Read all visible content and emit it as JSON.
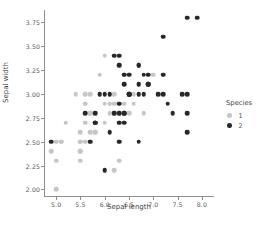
{
  "chart_data": {
    "type": "scatter",
    "title": "",
    "xlabel": "Sepal length",
    "ylabel": "Sepal width",
    "xlim": [
      4.75,
      8.25
    ],
    "ylim": [
      1.92,
      3.88
    ],
    "xticks": [
      "5.0",
      "5.5",
      "6.0",
      "6.5",
      "7.0",
      "7.5",
      "8.0"
    ],
    "xtick_values": [
      5.0,
      5.5,
      6.0,
      6.5,
      7.0,
      7.5,
      8.0
    ],
    "yticks": [
      "2.00",
      "2.25",
      "2.50",
      "2.75",
      "3.00",
      "3.25",
      "3.50",
      "3.75"
    ],
    "ytick_values": [
      2.0,
      2.25,
      2.5,
      2.75,
      3.0,
      3.25,
      3.5,
      3.75
    ],
    "grid": false,
    "legend": {
      "title": "Species",
      "position": "right",
      "entries": [
        {
          "label": "1",
          "color": "#c6c6c6"
        },
        {
          "label": "2",
          "color": "#272727"
        }
      ]
    },
    "series": [
      {
        "name": "1",
        "color": "#c6c6c6",
        "points": [
          [
            5.0,
            2.0
          ],
          [
            5.0,
            2.3
          ],
          [
            5.5,
            2.3
          ],
          [
            5.5,
            2.4
          ],
          [
            4.9,
            2.4
          ],
          [
            5.0,
            2.5
          ],
          [
            5.5,
            2.5
          ],
          [
            5.6,
            2.5
          ],
          [
            5.7,
            2.5
          ],
          [
            5.1,
            2.5
          ],
          [
            6.0,
            2.2
          ],
          [
            6.2,
            2.2
          ],
          [
            6.3,
            2.3
          ],
          [
            5.5,
            2.6
          ],
          [
            5.7,
            2.6
          ],
          [
            5.8,
            2.6
          ],
          [
            5.6,
            2.7
          ],
          [
            5.8,
            2.7
          ],
          [
            6.0,
            2.7
          ],
          [
            6.1,
            2.8
          ],
          [
            5.6,
            2.9
          ],
          [
            5.7,
            2.8
          ],
          [
            5.9,
            3.0
          ],
          [
            5.6,
            3.0
          ],
          [
            6.0,
            2.9
          ],
          [
            6.1,
            2.9
          ],
          [
            6.2,
            2.9
          ],
          [
            6.3,
            2.5
          ],
          [
            6.4,
            2.9
          ],
          [
            6.6,
            2.9
          ],
          [
            6.7,
            3.0
          ],
          [
            6.8,
            2.8
          ],
          [
            6.9,
            3.1
          ],
          [
            5.4,
            3.0
          ],
          [
            5.2,
            2.7
          ],
          [
            5.5,
            2.4
          ],
          [
            5.7,
            3.0
          ],
          [
            5.8,
            2.7
          ],
          [
            5.9,
            3.2
          ],
          [
            6.1,
            3.0
          ],
          [
            6.3,
            3.3
          ],
          [
            6.7,
            3.1
          ],
          [
            7.0,
            3.2
          ],
          [
            6.6,
            3.0
          ],
          [
            6.5,
            2.8
          ],
          [
            5.5,
            2.5
          ],
          [
            6.4,
            3.2
          ],
          [
            6.0,
            3.4
          ],
          [
            6.7,
            3.1
          ],
          [
            6.3,
            2.8
          ],
          [
            6.1,
            2.9
          ],
          [
            5.8,
            2.6
          ],
          [
            6.2,
            2.8
          ],
          [
            5.1,
            2.5
          ],
          [
            5.7,
            2.8
          ],
          [
            6.3,
            2.7
          ],
          [
            6.2,
            3.0
          ]
        ]
      },
      {
        "name": "2",
        "color": "#272727",
        "points": [
          [
            6.3,
            3.3
          ],
          [
            5.8,
            2.7
          ],
          [
            7.1,
            3.0
          ],
          [
            6.3,
            2.9
          ],
          [
            6.5,
            3.0
          ],
          [
            7.6,
            3.0
          ],
          [
            4.9,
            2.5
          ],
          [
            7.3,
            2.9
          ],
          [
            6.7,
            2.5
          ],
          [
            7.2,
            3.6
          ],
          [
            6.5,
            3.2
          ],
          [
            6.4,
            2.7
          ],
          [
            6.8,
            3.0
          ],
          [
            5.7,
            2.5
          ],
          [
            5.8,
            2.8
          ],
          [
            6.4,
            3.2
          ],
          [
            6.5,
            3.0
          ],
          [
            7.7,
            3.8
          ],
          [
            7.7,
            2.6
          ],
          [
            6.0,
            2.2
          ],
          [
            6.9,
            3.2
          ],
          [
            5.6,
            2.8
          ],
          [
            7.7,
            2.8
          ],
          [
            6.3,
            2.7
          ],
          [
            6.7,
            3.3
          ],
          [
            7.2,
            3.2
          ],
          [
            6.2,
            2.8
          ],
          [
            6.1,
            3.0
          ],
          [
            6.4,
            2.8
          ],
          [
            7.2,
            3.0
          ],
          [
            7.4,
            2.8
          ],
          [
            7.9,
            3.8
          ],
          [
            6.4,
            2.8
          ],
          [
            6.3,
            2.8
          ],
          [
            6.1,
            2.6
          ],
          [
            7.7,
            3.0
          ],
          [
            6.3,
            3.4
          ],
          [
            6.4,
            3.1
          ],
          [
            6.0,
            3.0
          ],
          [
            6.9,
            3.1
          ],
          [
            6.7,
            3.1
          ],
          [
            6.9,
            3.1
          ],
          [
            5.8,
            2.7
          ],
          [
            6.8,
            3.2
          ],
          [
            6.7,
            3.3
          ],
          [
            6.7,
            3.0
          ],
          [
            6.3,
            2.5
          ],
          [
            6.5,
            3.0
          ],
          [
            6.2,
            3.4
          ],
          [
            5.9,
            3.0
          ]
        ]
      }
    ]
  }
}
